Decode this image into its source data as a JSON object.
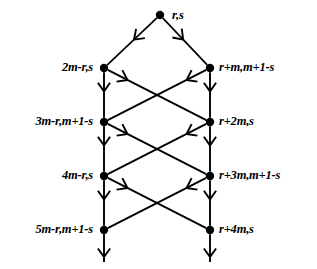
{
  "figure": {
    "type": "directed-graph-diagram",
    "background_color": "#ffffff",
    "stroke_color": "#000000",
    "root": {
      "label": "r,s",
      "x": 160,
      "y": 15
    },
    "rows": [
      {
        "y": 68,
        "left": {
          "label": "2m-r,s",
          "x": 104
        },
        "right": {
          "label": "r+m,m+1-s",
          "x": 210
        }
      },
      {
        "y": 122,
        "left": {
          "label": "3m-r,m+1-s",
          "x": 104
        },
        "right": {
          "label": "r+2m,s",
          "x": 210
        }
      },
      {
        "y": 176,
        "left": {
          "label": "4m-r,s",
          "x": 104
        },
        "right": {
          "label": "r+3m,m+1-s",
          "x": 210
        }
      },
      {
        "y": 230,
        "left": {
          "label": "5m-r,m+1-s",
          "x": 104
        },
        "right": {
          "label": "r+4m,s",
          "x": 210
        }
      }
    ]
  }
}
